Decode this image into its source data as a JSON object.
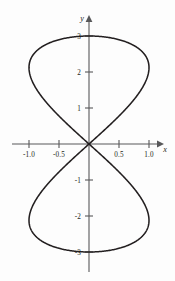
{
  "figure": {
    "background_color": "#fdfdfd",
    "curve_color": "#231f20",
    "axis_color": "#58585a",
    "axis_labels": {
      "x": "x",
      "y": "y"
    }
  },
  "chart_data": {
    "type": "line",
    "title": "",
    "subtitle": "",
    "xlabel": "x",
    "ylabel": "y",
    "grid": false,
    "legend": false,
    "xlim": [
      -1.35,
      1.35
    ],
    "ylim": [
      -3.45,
      3.45
    ],
    "xticks": [
      -1.0,
      -0.5,
      0.5,
      1.0
    ],
    "xtick_labels": [
      "-1.0",
      "-0.5",
      "0.5",
      "1.0"
    ],
    "yticks": [
      3,
      2,
      1,
      -1,
      -2,
      -3
    ],
    "ytick_labels": [
      "3",
      "2",
      "1",
      "-1",
      "-2",
      "-3"
    ],
    "curve_name": "figure-eight",
    "parametric": {
      "x": "sin(2t)",
      "y": "3*cos(t)",
      "t_range": [
        0,
        6.283185307179586
      ]
    },
    "series": [
      {
        "name": "figure-eight-curve",
        "x": [
          0.0,
          0.588,
          0.951,
          0.951,
          0.588,
          0.0,
          -0.588,
          -0.951,
          -0.951,
          -0.588,
          0.0,
          0.588,
          0.951,
          0.951,
          0.588,
          0.0,
          -0.588,
          -0.951,
          -0.951,
          -0.588,
          0.0
        ],
        "y": [
          3.0,
          2.853,
          2.427,
          1.763,
          0.927,
          0.0,
          -0.927,
          -1.763,
          -2.427,
          -2.853,
          -3.0,
          -2.853,
          -2.427,
          -1.763,
          -0.927,
          0.0,
          0.927,
          1.763,
          2.427,
          2.853,
          3.0
        ]
      }
    ],
    "annotations": []
  },
  "ticks": {
    "x": [
      {
        "value": -1.0,
        "label": "-1.0"
      },
      {
        "value": -0.5,
        "label": "-0.5"
      },
      {
        "value": 0.5,
        "label": "0.5"
      },
      {
        "value": 1.0,
        "label": "1.0"
      }
    ],
    "y": [
      {
        "value": 3,
        "label": "3"
      },
      {
        "value": 2,
        "label": "2"
      },
      {
        "value": 1,
        "label": "1"
      },
      {
        "value": -1,
        "label": "-1"
      },
      {
        "value": -2,
        "label": "-2"
      },
      {
        "value": -3,
        "label": "-3"
      }
    ]
  }
}
